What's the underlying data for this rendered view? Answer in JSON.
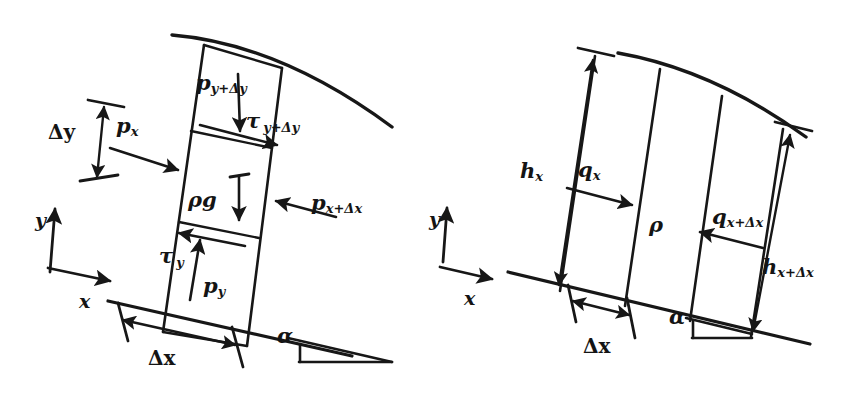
{
  "figure": {
    "ink_color": "#171717",
    "background_color": "#ffffff"
  },
  "left_diagram": {
    "name": "momentum-control-volume",
    "labels": {
      "p_top": {
        "base": "p",
        "sub": "y+Δy"
      },
      "tau_top": {
        "base": "τ",
        "sub": "y+Δy"
      },
      "p_left": {
        "base": "p",
        "sub": "x"
      },
      "p_right": {
        "base": "p",
        "sub": "x+Δx"
      },
      "body_force": {
        "base": "ρg",
        "sub": ""
      },
      "tau_bottom": {
        "base": "τ",
        "sub": "y"
      },
      "p_bottom": {
        "base": "p",
        "sub": "y"
      },
      "delta_y": "Δy",
      "delta_x": "Δx",
      "alpha": "α",
      "axis_x": "x",
      "axis_y": "y"
    }
  },
  "right_diagram": {
    "name": "mass-control-volume",
    "labels": {
      "h_left": {
        "base": "h",
        "sub": "x"
      },
      "h_right": {
        "base": "h",
        "sub": "x+Δx"
      },
      "q_left": {
        "base": "q",
        "sub": "x"
      },
      "q_right": {
        "base": "q",
        "sub": "x+Δx"
      },
      "density": {
        "base": "ρ",
        "sub": ""
      },
      "delta_x": "Δx",
      "alpha": "α",
      "axis_x": "x",
      "axis_y": "y"
    }
  }
}
